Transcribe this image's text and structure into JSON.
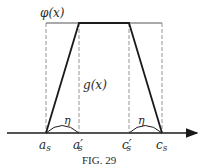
{
  "figure": {
    "caption": "Fig. 29",
    "caption_display": "FIG. 29",
    "colors": {
      "thick_line": "#1a1a1a",
      "thin_line": "#555555",
      "dashed_line": "#888888",
      "text": "#2a2a2a",
      "background": "#ffffff"
    },
    "labels": {
      "phi": "φ(x)",
      "g": "g(x)",
      "eta_left": "η",
      "eta_right": "η",
      "a_s": "a",
      "a_s_sub": "s",
      "a_prime_s": "a′",
      "a_prime_s_sub": "s",
      "c_prime_s": "c′",
      "c_prime_s_sub": "s",
      "c_s": "c",
      "c_s_sub": "s"
    },
    "points": {
      "a_s_x": 46,
      "a_prime_s_x": 79,
      "c_prime_s_x": 129,
      "c_s_x": 162,
      "baseline_y": 133,
      "top_y": 23
    }
  }
}
